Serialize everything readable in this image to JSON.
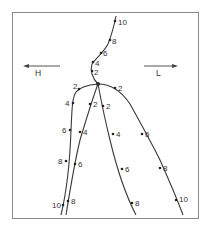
{
  "diagram": {
    "labels": {
      "left_arrow": "H",
      "right_arrow": "L"
    },
    "trunk": {
      "markers": [
        "10",
        "8",
        "6",
        "4",
        "2"
      ]
    },
    "branches": [
      {
        "name": "far-left",
        "markers": [
          "2",
          "4",
          "6",
          "8",
          "10"
        ]
      },
      {
        "name": "inner-left",
        "markers": [
          "2",
          "4",
          "6",
          "8"
        ]
      },
      {
        "name": "inner-right",
        "markers": [
          "2",
          "4",
          "6",
          "8"
        ]
      },
      {
        "name": "far-right",
        "markers": [
          "2",
          "6",
          "8",
          "10"
        ]
      }
    ],
    "colors": {
      "line": "#3a3a3a",
      "frame": "#8a8a8a",
      "background": "#ffffff"
    }
  }
}
